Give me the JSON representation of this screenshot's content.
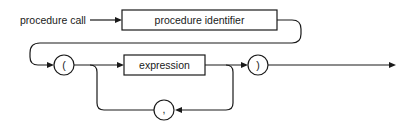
{
  "diagram": {
    "title": "procedure call",
    "nodes": {
      "procedure_identifier": "procedure identifier",
      "open_paren": "(",
      "expression": "expression",
      "close_paren": ")",
      "comma": ","
    },
    "colors": {
      "stroke": "#1a1a1a",
      "background": "#ffffff"
    }
  }
}
